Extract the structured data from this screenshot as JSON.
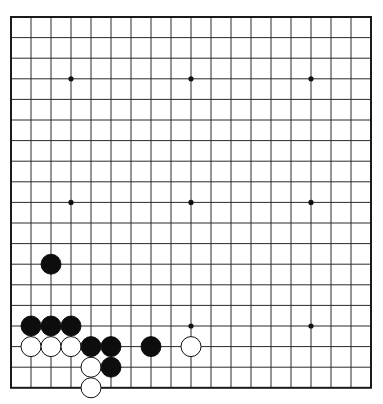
{
  "board": {
    "size": 19,
    "origin_x": 11,
    "origin_y": 17,
    "col_spacing": 20,
    "row_spacing": 20.6,
    "stone_radius": 10,
    "line_color": "#2a2a2a",
    "background": "#ffffff",
    "star_points": [
      [
        3,
        3
      ],
      [
        9,
        3
      ],
      [
        15,
        3
      ],
      [
        3,
        9
      ],
      [
        9,
        9
      ],
      [
        15,
        9
      ],
      [
        3,
        15
      ],
      [
        9,
        15
      ],
      [
        15,
        15
      ]
    ],
    "stones": [
      {
        "color": "black",
        "col": 2,
        "row": 12
      },
      {
        "color": "black",
        "col": 1,
        "row": 15
      },
      {
        "color": "black",
        "col": 2,
        "row": 15
      },
      {
        "color": "black",
        "col": 3,
        "row": 15
      },
      {
        "color": "white",
        "col": 1,
        "row": 16
      },
      {
        "color": "white",
        "col": 2,
        "row": 16
      },
      {
        "color": "white",
        "col": 3,
        "row": 16
      },
      {
        "color": "black",
        "col": 4,
        "row": 16
      },
      {
        "color": "black",
        "col": 5,
        "row": 16
      },
      {
        "color": "black",
        "col": 7,
        "row": 16
      },
      {
        "color": "white",
        "col": 9,
        "row": 16
      },
      {
        "color": "white",
        "col": 4,
        "row": 17
      },
      {
        "color": "black",
        "col": 5,
        "row": 17
      },
      {
        "color": "white",
        "col": 4,
        "row": 18
      }
    ]
  }
}
